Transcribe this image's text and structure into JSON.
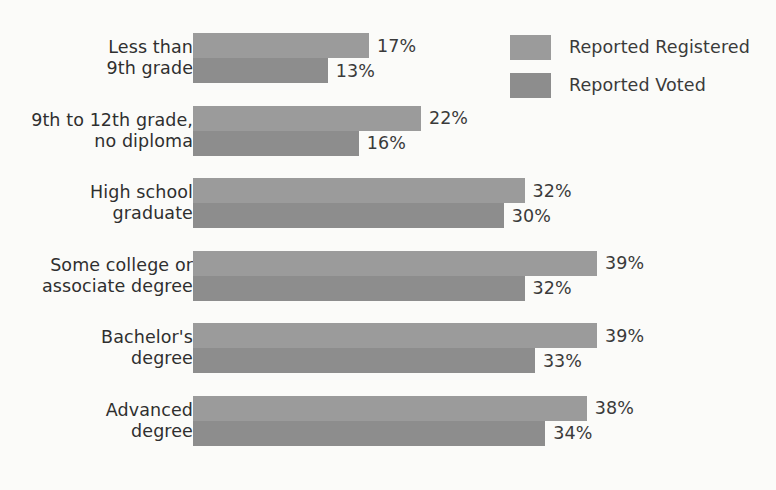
{
  "chart_data": {
    "type": "bar",
    "orientation": "horizontal",
    "title": "",
    "subtitle": "",
    "xlabel": "",
    "ylabel": "",
    "grid": false,
    "legend_position": "top-right",
    "value_suffix": "%",
    "axis_max_percent": 39,
    "px_per_percent": 10.36,
    "categories": [
      "Less than\n9th grade",
      "9th to 12th grade,\nno diploma",
      "High school\ngraduate",
      "Some college or\nassociate degree",
      "Bachelor's\ndegree",
      "Advanced\ndegree"
    ],
    "category_lines": [
      [
        "Less than",
        "9th grade"
      ],
      [
        "9th to 12th grade,",
        "no diploma"
      ],
      [
        "High school",
        "graduate"
      ],
      [
        "Some college or",
        "associate degree"
      ],
      [
        "Bachelor's",
        "degree"
      ],
      [
        "Advanced",
        "degree"
      ]
    ],
    "series": [
      {
        "name": "Reported Registered",
        "color": "#9b9b9b",
        "values": [
          17,
          22,
          32,
          39,
          39,
          38
        ],
        "labels": [
          "17%",
          "22%",
          "32%",
          "39%",
          "39%",
          "38%"
        ]
      },
      {
        "name": "Reported Voted",
        "color": "#8d8d8d",
        "values": [
          13,
          16,
          30,
          32,
          33,
          34
        ],
        "labels": [
          "13%",
          "16%",
          "30%",
          "32%",
          "33%",
          "34%"
        ]
      }
    ]
  },
  "legend": {
    "items": [
      {
        "label": "Reported Registered",
        "swatch_class": "registered",
        "color": "#9b9b9b"
      },
      {
        "label": "Reported Voted",
        "swatch_class": "voted",
        "color": "#8d8d8d"
      }
    ]
  },
  "colors": {
    "background": "#fbfbf9",
    "text": "#3a3a3a",
    "registered": "#9b9b9b",
    "voted": "#8d8d8d"
  }
}
